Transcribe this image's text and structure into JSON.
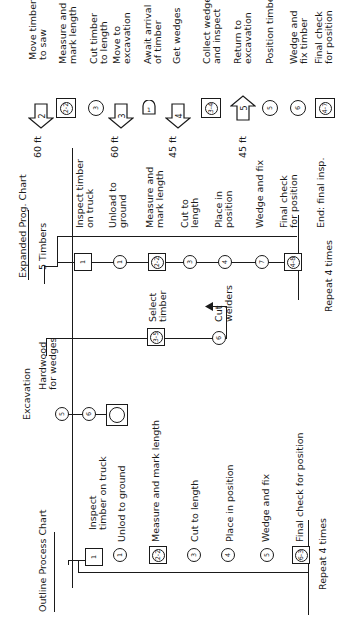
{
  "outline": {
    "title": "Outline Process Chart",
    "steps": [
      {
        "symbol": "inspection",
        "num": "1",
        "label": "Inspect\ntimber on truck"
      },
      {
        "symbol": "operation",
        "num": "1",
        "label": "Unlod to ground"
      },
      {
        "symbol": "combined",
        "num": "2-2",
        "label": "Measure and mark length"
      },
      {
        "symbol": "operation",
        "num": "3",
        "label": "Cut to length"
      },
      {
        "symbol": "operation",
        "num": "4",
        "label": "Place in position"
      },
      {
        "symbol": "operation",
        "num": "5",
        "label": "Wedge and fix"
      },
      {
        "symbol": "combined",
        "num": "6-3",
        "label": "Final check for position"
      }
    ],
    "repeat": "Repeat 4 times"
  },
  "excavation": {
    "title": "Excavation",
    "symbols": [
      "5",
      "6",
      ""
    ]
  },
  "wedges": {
    "label": "Hardwood\nfor wedges",
    "steps": [
      {
        "symbol": "combined",
        "num": "3-5",
        "label": "Select\ntimber"
      },
      {
        "symbol": "operation",
        "num": "6",
        "label": "Cut\nwelders"
      }
    ]
  },
  "expanded": {
    "title": "Expanded Prog. Chart",
    "subtitle": "5 Timbers",
    "steps": [
      {
        "symbol": "inspection",
        "num": "1",
        "label": "Inspect timber\non truck"
      },
      {
        "symbol": "operation",
        "num": "1",
        "label": "Unload to\nground"
      },
      {
        "symbol": "combined",
        "num": "2-2",
        "label": "Measure and\nmark length"
      },
      {
        "symbol": "operation",
        "num": "3",
        "label": "Cut to\nlength"
      },
      {
        "symbol": "operation",
        "num": "4",
        "label": "Place in\nposition"
      },
      {
        "symbol": "operation",
        "num": "7",
        "label": "Wedge and fix"
      },
      {
        "symbol": "combined",
        "num": "4-8",
        "label": "Final check\nfor position"
      }
    ],
    "repeat": "Repeat 4 times",
    "end": "End: final insp."
  },
  "flow": {
    "steps": [
      {
        "symbol": "transport",
        "num": "2",
        "distance": "60 ft",
        "label": "Move timber\nto saw"
      },
      {
        "symbol": "combined",
        "num": "2-2",
        "distance": "",
        "label": "Measure and\nmark length"
      },
      {
        "symbol": "operation",
        "num": "3",
        "distance": "",
        "label": "Cut timber\nto length"
      },
      {
        "symbol": "transport",
        "num": "3",
        "distance": "60 ft",
        "label": "Move to\nexcavation"
      },
      {
        "symbol": "delay",
        "num": "1",
        "distance": "",
        "label": "Await arrival\nof timber"
      },
      {
        "symbol": "transport",
        "num": "4",
        "distance": "45 ft",
        "label": "Get wedges"
      },
      {
        "symbol": "combined",
        "num": "3-4",
        "distance": "",
        "label": "Collect wedges\nand inspect"
      },
      {
        "symbol": "transport-return",
        "num": "5",
        "distance": "45 ft",
        "label": "Return to\nexcavation"
      },
      {
        "symbol": "operation",
        "num": "5",
        "distance": "",
        "label": "Position timber"
      },
      {
        "symbol": "operation",
        "num": "6",
        "distance": "",
        "label": "Wedge and\nfix timber"
      },
      {
        "symbol": "combined",
        "num": "4-7",
        "distance": "",
        "label": "Final check\nfor position"
      }
    ]
  }
}
